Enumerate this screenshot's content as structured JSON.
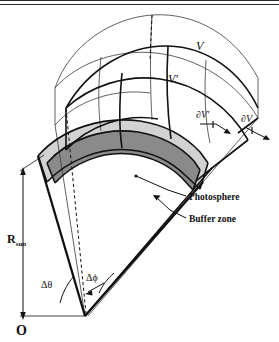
{
  "figure": {
    "origin_label": "O",
    "radius_label": "R",
    "radius_subscript": "sun",
    "theta_label": "Δθ",
    "phi_label": "Δϕ",
    "volume_outer_label": "V",
    "volume_inner_label": "V′",
    "boundary_outer_label": "∂V",
    "boundary_inner_label": "∂V′",
    "photosphere_label": "Photosphere",
    "buffer_label": "Buffer zone"
  },
  "colors": {
    "line": "#1a1a1a",
    "thin_line": "#333333",
    "photosphere_fill": "#8a8a8a",
    "buffer_fill": "#d2d2d2",
    "background": "#ffffff",
    "border": "#2a2a2a"
  }
}
